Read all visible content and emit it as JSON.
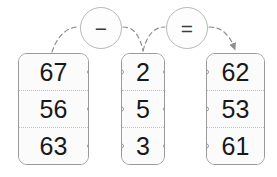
{
  "diagram": {
    "background_color": "#ffffff",
    "line_color": "#9a9a9a",
    "text_color": "#191919"
  },
  "operators": [
    {
      "id": "minus",
      "symbol": "−",
      "name": "minus-operator",
      "icon": "minus-icon"
    },
    {
      "id": "equals",
      "symbol": "=",
      "name": "equals-operator",
      "icon": "equals-icon"
    }
  ],
  "columns": [
    {
      "id": "minuend",
      "name": "left-number-card",
      "values": [
        "67",
        "56",
        "63"
      ],
      "ports": {
        "left": false,
        "right": true
      }
    },
    {
      "id": "subtrahend",
      "name": "middle-number-card",
      "values": [
        "2",
        "5",
        "3"
      ],
      "ports": {
        "left": true,
        "right": true
      }
    },
    {
      "id": "difference",
      "name": "right-number-card",
      "values": [
        "62",
        "53",
        "61"
      ],
      "ports": {
        "left": true,
        "right": false
      }
    }
  ],
  "connections": [
    {
      "id": "left-to-minus",
      "from": "minuend",
      "to": "minus",
      "style": "dashed-curve",
      "arrow": false
    },
    {
      "id": "minus-to-middle",
      "from": "minus",
      "to": "subtrahend",
      "style": "dashed-curve",
      "arrow": false
    },
    {
      "id": "middle-to-equals",
      "from": "subtrahend",
      "to": "equals",
      "style": "dashed-curve",
      "arrow": false
    },
    {
      "id": "equals-to-right",
      "from": "equals",
      "to": "difference",
      "style": "dashed-curve",
      "arrow": true
    }
  ]
}
